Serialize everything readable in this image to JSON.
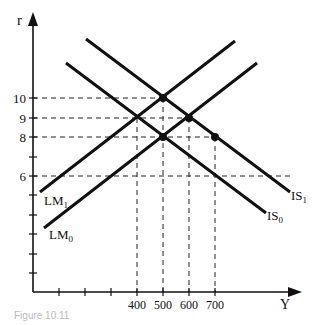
{
  "diagram": {
    "type": "IS-LM",
    "axes": {
      "y_label": "r",
      "x_label": "Y",
      "y_ticks": [
        {
          "label": "10",
          "value": 10,
          "py": 98
        },
        {
          "label": "9",
          "value": 9,
          "py": 118
        },
        {
          "label": "8",
          "value": 8,
          "py": 137
        },
        {
          "label": "6",
          "value": 6,
          "py": 176
        }
      ],
      "x_ticks": [
        {
          "label": "400",
          "value": 400,
          "px": 137
        },
        {
          "label": "500",
          "value": 500,
          "px": 163
        },
        {
          "label": "600",
          "value": 600,
          "px": 189
        },
        {
          "label": "700",
          "value": 700,
          "px": 215
        }
      ]
    },
    "curves": [
      {
        "name": "IS1",
        "label_main": "IS",
        "label_sub": "1",
        "x1": 86,
        "y1": 39,
        "x2": 290,
        "y2": 192
      },
      {
        "name": "IS0",
        "label_main": "IS",
        "label_sub": "0",
        "x1": 66,
        "y1": 63,
        "x2": 266,
        "y2": 213
      },
      {
        "name": "LM1",
        "label_main": "LM",
        "label_sub": "1",
        "x1": 40,
        "y1": 192,
        "x2": 235,
        "y2": 41
      },
      {
        "name": "LM0",
        "label_main": "LM",
        "label_sub": "0",
        "x1": 44,
        "y1": 228,
        "x2": 257,
        "y2": 63
      }
    ],
    "points": [
      {
        "Y": 500,
        "r": 10,
        "desc": "IS1 ∩ LM1"
      },
      {
        "Y": 600,
        "r": 9,
        "desc": "IS1 ∩ LM0"
      },
      {
        "Y": 500,
        "r": 8,
        "desc": "IS0 ∩ LM0"
      },
      {
        "Y": 700,
        "r": 8,
        "desc": "IS1 at r=8"
      }
    ],
    "caption": "Figure 10.11"
  }
}
